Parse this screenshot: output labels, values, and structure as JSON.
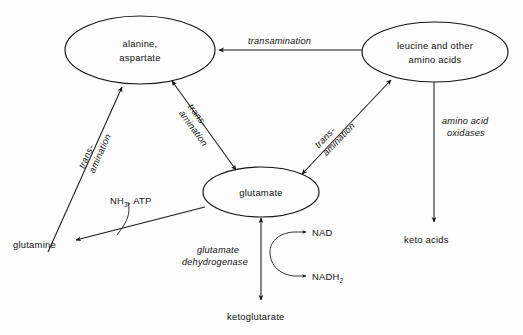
{
  "diagram": {
    "nodes": [
      {
        "id": "alanine_aspartate",
        "lines": [
          "alanine,",
          "aspartate"
        ],
        "shape": "ellipse"
      },
      {
        "id": "leucine_other",
        "lines": [
          "leucine and other",
          "amino acids"
        ],
        "shape": "ellipse"
      },
      {
        "id": "glutamate",
        "lines": [
          "glutamate"
        ],
        "shape": "ellipse"
      },
      {
        "id": "glutamine",
        "lines": [
          "glutamine"
        ],
        "shape": "plain"
      },
      {
        "id": "keto_acids",
        "lines": [
          "keto acids"
        ],
        "shape": "plain"
      },
      {
        "id": "ketoglutarate",
        "lines": [
          "ketoglutarate"
        ],
        "shape": "plain"
      },
      {
        "id": "nad",
        "lines": [
          "NAD"
        ],
        "shape": "plain"
      },
      {
        "id": "nadh2",
        "lines": [
          "NADH",
          "2"
        ],
        "shape": "plain-sub"
      }
    ],
    "edge_labels": {
      "transamination_top": "transamination",
      "trans_left_1": "trans-",
      "trans_left_2": "amination",
      "trans_mid_1": "trans-",
      "trans_mid_2": "amination",
      "trans_right_1": "trans-",
      "trans_right_2": "amination",
      "amino_acid_oxidases_1": "amino acid",
      "amino_acid_oxidases_2": "oxidases",
      "glutamate_dehydrogenase_1": "glutamate",
      "glutamate_dehydrogenase_2": "dehydrogenase"
    },
    "reagents": {
      "nh3_atp_main": "NH",
      "nh3_atp_sub": "3",
      "nh3_atp_tail": ", ATP"
    },
    "node_text": {
      "alanine_line1": "alanine,",
      "alanine_line2": "aspartate",
      "leucine_line1": "leucine and other",
      "leucine_line2": "amino acids",
      "glutamate": "glutamate",
      "glutamine": "glutamine",
      "keto_acids": "keto acids",
      "ketoglutarate": "ketoglutarate",
      "nad": "NAD",
      "nadh2_main": "NADH",
      "nadh2_sub": "2"
    },
    "colors": {
      "stroke": "#141414",
      "text": "#101010",
      "background": "#ffffff"
    }
  }
}
